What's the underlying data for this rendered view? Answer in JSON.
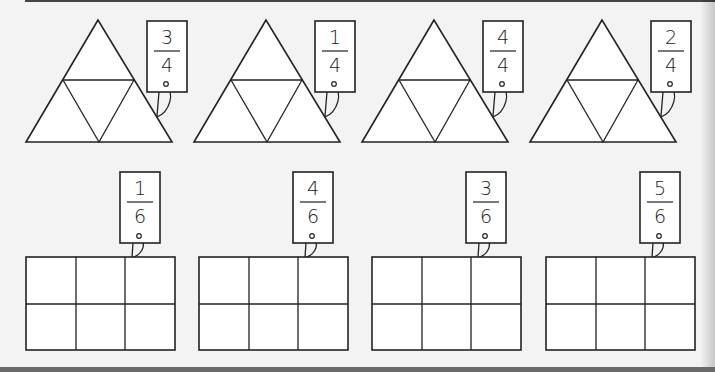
{
  "worksheet": {
    "colors": {
      "line": "#222222",
      "paper": "#f3f3f3",
      "shape_fill": "#ffffff",
      "bottom_band": "#6a6a6a"
    },
    "triangles": [
      {
        "numerator": "3",
        "denominator": "4",
        "parts": 4
      },
      {
        "numerator": "1",
        "denominator": "4",
        "parts": 4
      },
      {
        "numerator": "4",
        "denominator": "4",
        "parts": 4
      },
      {
        "numerator": "2",
        "denominator": "4",
        "parts": 4
      }
    ],
    "rectangles": [
      {
        "numerator": "1",
        "denominator": "6",
        "parts": 6
      },
      {
        "numerator": "4",
        "denominator": "6",
        "parts": 6
      },
      {
        "numerator": "3",
        "denominator": "6",
        "parts": 6
      },
      {
        "numerator": "5",
        "denominator": "6",
        "parts": 6
      }
    ]
  }
}
